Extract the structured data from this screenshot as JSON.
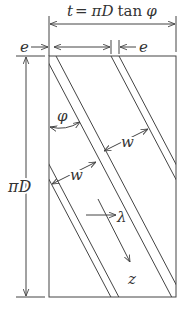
{
  "diagram": {
    "title_dimension": {
      "lhs": "t",
      "eq": "=",
      "rhs_pi": "π",
      "rhs_D": "D",
      "rhs_tan": "tan",
      "rhs_phi": "φ"
    },
    "labels": {
      "e_left": "e",
      "e_right": "e",
      "height": {
        "pi": "π",
        "D": "D"
      },
      "angle": "φ",
      "width_1": "w",
      "width_2": "w",
      "lambda": "λ",
      "z": "z"
    },
    "colors": {
      "line": "#444444",
      "text": "#333333",
      "background": "#ffffff"
    }
  }
}
